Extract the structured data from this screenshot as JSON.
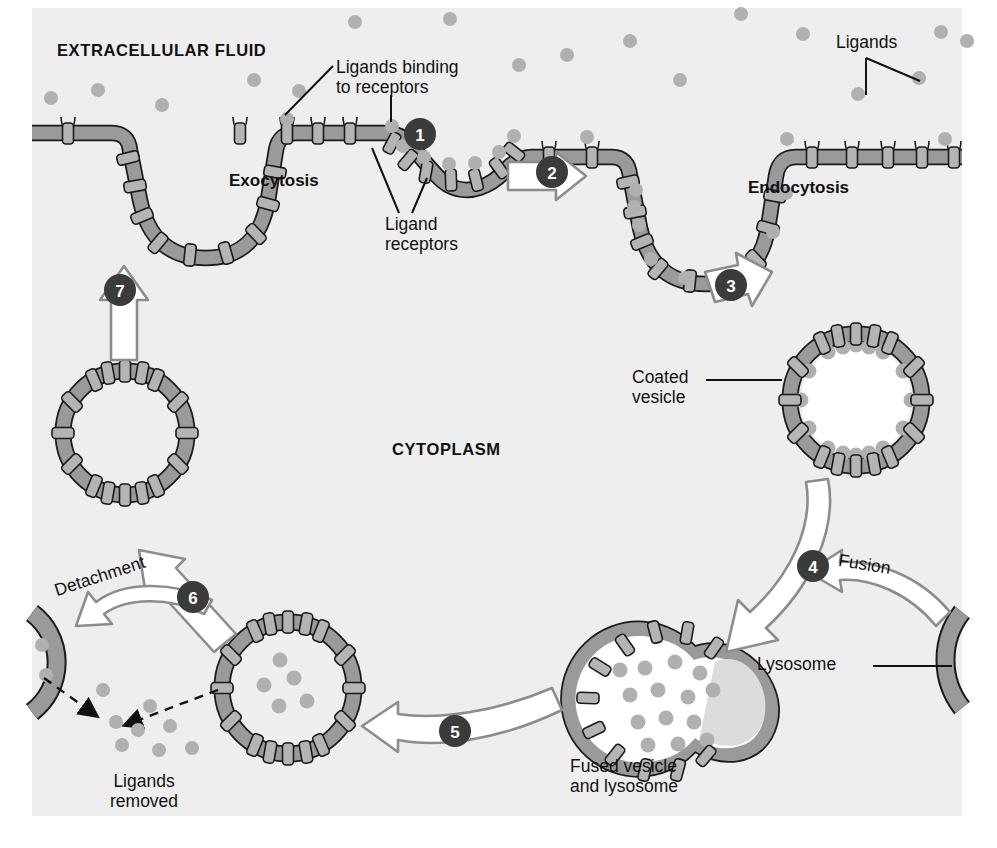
{
  "figure": {
    "background_color": "#eeeeee",
    "membrane_fill": "#9a9a9a",
    "membrane_stroke": "#1a1a1a",
    "receptor_fill": "#b4b4b4",
    "ligand_fill": "#b0b0b0",
    "arrow_fill": "#ffffff",
    "arrow_stroke": "#8c8c8c",
    "step_badge_fill": "#3b3b3b",
    "step_badge_text_color": "#ffffff",
    "vesicle_lumen": "#ffffff"
  },
  "labels": {
    "extracellular_fluid": "EXTRACELLULAR FLUID",
    "cytoplasm": "CYTOPLASM",
    "exocytosis": "Exocytosis",
    "endocytosis": "Endocytosis",
    "ligands_binding_to_receptors": "Ligands binding\nto receptors",
    "ligand_receptors": "Ligand\nreceptors",
    "ligands": "Ligands",
    "coated_vesicle": "Coated\nvesicle",
    "lysosome": "Lysosome",
    "fusion": "Fusion",
    "detachment": "Detachment",
    "ligands_removed": "Ligands\nremoved",
    "fused_vesicle_and_lysosome": "Fused vesicle\nand lysosome"
  },
  "steps": [
    {
      "number": "1",
      "x": 420,
      "y": 134,
      "description": "Ligands bind to receptors on plasma membrane"
    },
    {
      "number": "2",
      "x": 552,
      "y": 172,
      "description": "Membrane invaginates forming coated pit"
    },
    {
      "number": "3",
      "x": 731,
      "y": 285,
      "description": "Coated vesicle pinches off into cytoplasm"
    },
    {
      "number": "4",
      "x": 813,
      "y": 566,
      "description": "Vesicle fuses with lysosome"
    },
    {
      "number": "5",
      "x": 455,
      "y": 731,
      "description": "Fused vesicle and lysosome move into cytoplasm"
    },
    {
      "number": "6",
      "x": 193,
      "y": 597,
      "description": "Ligands detach from receptors"
    },
    {
      "number": "7",
      "x": 120,
      "y": 290,
      "description": "Receptor vesicle returns to plasma membrane"
    }
  ],
  "annotations": [
    {
      "name": "ligands-binding-to-receptors",
      "text": "Ligands binding\nto receptors",
      "x": 336,
      "y": 58
    },
    {
      "name": "ligand-receptors",
      "text": "Ligand\nreceptors",
      "x": 385,
      "y": 218
    },
    {
      "name": "ligands",
      "text": "Ligands",
      "x": 836,
      "y": 33
    },
    {
      "name": "coated-vesicle",
      "text": "Coated\nvesicle",
      "x": 632,
      "y": 372
    },
    {
      "name": "lysosome",
      "text": "Lysosome",
      "x": 757,
      "y": 659
    },
    {
      "name": "fusion",
      "text": "Fusion",
      "x": 840,
      "y": 560
    },
    {
      "name": "detachment",
      "text": "Detachment",
      "x": 57,
      "y": 571
    },
    {
      "name": "ligands-removed",
      "text": "Ligands\nremoved",
      "x": 108,
      "y": 775
    },
    {
      "name": "fused-vesicle-and-lysosome",
      "text": "Fused vesicle\nand lysosome",
      "x": 570,
      "y": 760
    },
    {
      "name": "extracellular-fluid",
      "text": "EXTRACELLULAR FLUID",
      "x": 57,
      "y": 41
    },
    {
      "name": "cytoplasm",
      "text": "CYTOPLASM",
      "x": 392,
      "y": 440
    },
    {
      "name": "exocytosis",
      "text": "Exocytosis",
      "x": 229,
      "y": 171
    },
    {
      "name": "endocytosis",
      "text": "Endocytosis",
      "x": 748,
      "y": 178
    }
  ]
}
